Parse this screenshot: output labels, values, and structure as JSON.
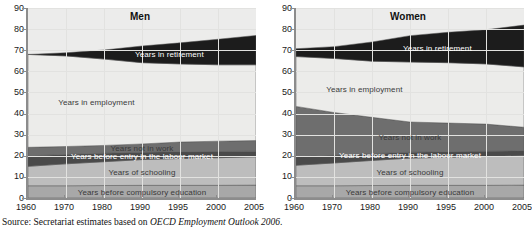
{
  "source_note": {
    "prefix": "Source:",
    "text_before": "Secretariat estimates based on",
    "italic": "OECD Employment Outlook 2006",
    "text_after": "."
  },
  "chart_data": {
    "type": "area",
    "title": "",
    "xlabel": "",
    "ylabel": "",
    "ylim": [
      0,
      90
    ],
    "yticks": [
      0,
      10,
      20,
      30,
      40,
      50,
      60,
      70,
      80,
      90
    ],
    "grid": true,
    "legend": "inline-band-labels",
    "x": [
      1960,
      1970,
      1980,
      1990,
      1995,
      2000,
      2005
    ],
    "xtick_labels": [
      "1960",
      "1970",
      "1980",
      "1990",
      "1995",
      "2000",
      "2005"
    ],
    "colors": {
      "retirement": "#1c1c1c",
      "employment": "#ececea",
      "not_in_work": "#6e6e6e",
      "before_entry": "#4a4a4a",
      "schooling": "#bdbdbd",
      "before_compulsory": "#a8a8a8",
      "plot_background": "#ececeb",
      "axis": "#8c8c8c",
      "gridline": "#e2e2e0"
    },
    "panels": [
      {
        "name": "men",
        "title": "Men",
        "band_labels": {
          "retirement": "Years in retirement",
          "employment": "Years in employment",
          "not_in_work": "Years not in work",
          "before_entry": "Years before entry in the labour market",
          "schooling": "Years of schooling",
          "before_compulsory": "Years before compulsory education"
        },
        "series": [
          {
            "name": "Years before compulsory education",
            "values": [
              5.8,
              5.8,
              5.9,
              6.0,
              6.0,
              6.0,
              6.1
            ]
          },
          {
            "name": "Years of schooling",
            "values": [
              9.2,
              10.4,
              11.3,
              12.2,
              12.7,
              13.1,
              13.4
            ]
          },
          {
            "name": "Years before entry in the labour market",
            "values": [
              4.9,
              4.4,
              4.0,
              3.5,
              3.2,
              2.9,
              2.7
            ]
          },
          {
            "name": "Years not in work",
            "values": [
              4.1,
              3.8,
              3.7,
              3.9,
              4.6,
              4.9,
              5.0
            ]
          },
          {
            "name": "Years in employment",
            "values": [
              44.0,
              42.9,
              40.9,
              38.5,
              37.0,
              36.2,
              35.9
            ]
          },
          {
            "name": "Years in retirement",
            "values": [
              0.0,
              1.5,
              4.3,
              7.9,
              10.0,
              12.1,
              13.9
            ]
          }
        ],
        "cumulative_tops": {
          "before_compulsory": [
            5.8,
            5.8,
            5.9,
            6.0,
            6.0,
            6.0,
            6.1
          ],
          "schooling": [
            15.0,
            16.2,
            17.2,
            18.2,
            18.7,
            19.1,
            19.5
          ],
          "before_entry": [
            19.9,
            20.6,
            21.2,
            21.7,
            21.9,
            22.0,
            22.2
          ],
          "not_in_work": [
            24.0,
            24.4,
            24.9,
            25.6,
            26.5,
            26.9,
            27.2
          ],
          "employment": [
            68.0,
            67.3,
            65.8,
            64.1,
            63.5,
            63.1,
            63.1
          ],
          "retirement": [
            68.0,
            68.8,
            70.1,
            72.0,
            73.5,
            75.2,
            77.0
          ]
        }
      },
      {
        "name": "women",
        "title": "Women",
        "band_labels": {
          "retirement": "Years in retirement",
          "employment": "Years in employment",
          "not_in_work": "Years not in work",
          "before_entry": "Years before entry in the labour market",
          "schooling": "Years of schooling",
          "before_compulsory": "Years before compulsory education"
        },
        "series": [
          {
            "name": "Years before compulsory education",
            "values": [
              5.8,
              5.8,
              5.9,
              6.0,
              6.0,
              6.0,
              6.1
            ]
          },
          {
            "name": "Years of schooling",
            "values": [
              9.7,
              10.8,
              11.9,
              12.9,
              13.3,
              13.7,
              14.0
            ]
          },
          {
            "name": "Years before entry in the labour market",
            "values": [
              4.0,
              3.6,
              3.2,
              2.8,
              2.6,
              2.4,
              2.3
            ]
          },
          {
            "name": "Years not in work",
            "values": [
              23.9,
              20.3,
              17.2,
              14.3,
              13.6,
              12.9,
              11.1
            ]
          },
          {
            "name": "Years in employment",
            "values": [
              23.6,
              25.6,
              26.6,
              28.4,
              28.6,
              28.5,
              28.6
            ]
          },
          {
            "name": "Years in retirement",
            "values": [
              3.7,
              5.6,
              9.1,
              12.5,
              14.4,
              16.2,
              19.8
            ]
          }
        ],
        "cumulative_tops": {
          "before_compulsory": [
            5.8,
            5.8,
            5.9,
            6.0,
            6.0,
            6.0,
            6.1
          ],
          "schooling": [
            15.5,
            16.6,
            17.8,
            18.9,
            19.3,
            19.7,
            20.1
          ],
          "before_entry": [
            19.5,
            20.2,
            21.0,
            21.7,
            21.9,
            22.1,
            22.4
          ],
          "not_in_work": [
            43.4,
            40.5,
            38.2,
            36.0,
            35.5,
            35.0,
            33.5
          ],
          "employment": [
            67.0,
            66.1,
            64.8,
            64.4,
            64.1,
            63.5,
            62.1
          ],
          "retirement": [
            70.7,
            71.7,
            73.9,
            76.9,
            78.5,
            79.7,
            81.9
          ]
        }
      }
    ]
  }
}
